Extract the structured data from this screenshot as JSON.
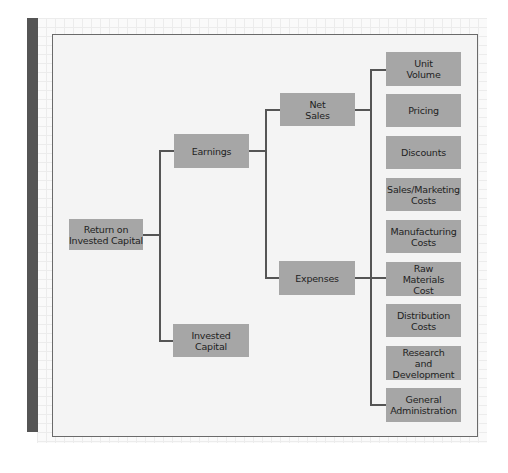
{
  "diagram": {
    "type": "tree",
    "root": {
      "label": "Return on\nInvested Capital"
    },
    "level1": [
      {
        "id": "earnings",
        "label": "Earnings"
      },
      {
        "id": "invested_capital",
        "label": "Invested\nCapital"
      }
    ],
    "level2": [
      {
        "id": "net_sales",
        "label": "Net\nSales",
        "parent": "earnings"
      },
      {
        "id": "expenses",
        "label": "Expenses",
        "parent": "earnings"
      }
    ],
    "level3": [
      {
        "id": "unit_volume",
        "label": "Unit\nVolume"
      },
      {
        "id": "pricing",
        "label": "Pricing"
      },
      {
        "id": "discounts",
        "label": "Discounts"
      },
      {
        "id": "sales_marketing_costs",
        "label": "Sales/Marketing\nCosts"
      },
      {
        "id": "manufacturing_costs",
        "label": "Manufacturing\nCosts"
      },
      {
        "id": "raw_materials_cost",
        "label": "Raw\nMaterials\nCost"
      },
      {
        "id": "distribution_costs",
        "label": "Distribution\nCosts"
      },
      {
        "id": "research_development",
        "label": "Research\nand\nDevelopment"
      },
      {
        "id": "general_administration",
        "label": "General\nAdministration"
      }
    ],
    "colors": {
      "node_fill": "#a6a6a6",
      "connector": "#555555",
      "frame_fill": "#f4f4f4",
      "side_bar": "#555555"
    }
  }
}
